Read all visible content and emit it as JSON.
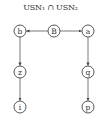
{
  "title": "USN₁ ∩ USN₂",
  "nodes": [
    {
      "id": "b",
      "label": "b",
      "x": 20,
      "y": 31
    },
    {
      "id": "B",
      "label": "B",
      "x": 54,
      "y": 31
    },
    {
      "id": "a",
      "label": "a",
      "x": 88,
      "y": 31
    },
    {
      "id": "z",
      "label": "z",
      "x": 20,
      "y": 72
    },
    {
      "id": "q",
      "label": "q",
      "x": 88,
      "y": 72
    },
    {
      "id": "i",
      "label": "i",
      "x": 20,
      "y": 107
    },
    {
      "id": "p",
      "label": "p",
      "x": 88,
      "y": 107
    }
  ],
  "edges": [
    {
      "from": "B",
      "to": "b"
    },
    {
      "from": "B",
      "to": "a"
    },
    {
      "from": "b",
      "to": "z"
    },
    {
      "from": "z",
      "to": "i"
    },
    {
      "from": "a",
      "to": "q"
    },
    {
      "from": "q",
      "to": "p"
    }
  ]
}
